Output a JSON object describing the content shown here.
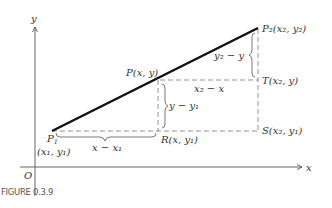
{
  "figure": {
    "caption": "FIGURE 0.3.9",
    "axes": {
      "x_label": "x",
      "y_label": "y",
      "origin_label": "O"
    },
    "points": {
      "P1": {
        "name": "P",
        "sub": "1",
        "coords": "(x₁, y₁)"
      },
      "P": {
        "text": "P(x, y)"
      },
      "P2": {
        "text": "P₂(x₂, y₂)"
      },
      "R": {
        "text": "R(x, y₁)"
      },
      "T": {
        "text": "T(x₂, y)"
      },
      "S": {
        "text": "S(x₂, y₁)"
      }
    },
    "differences": {
      "x_minus_x1": "x − x₁",
      "y_minus_y1": "y − y₁",
      "x2_minus_x": "x₂ − x",
      "y2_minus_y": "y₂ − y"
    },
    "colors": {
      "segment": "#111111",
      "axis": "#555555",
      "dashed": "#777777"
    }
  }
}
